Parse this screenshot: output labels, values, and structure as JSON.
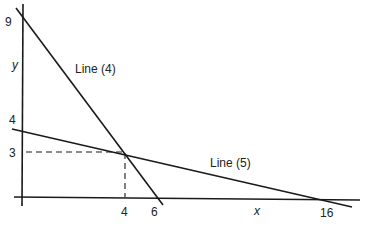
{
  "axes": {
    "x_label": "x",
    "y_label": "y",
    "x_ticks": [
      "4",
      "6",
      "16"
    ],
    "y_ticks": [
      "9",
      "4",
      "3"
    ]
  },
  "lines": [
    {
      "label": "Line (4)",
      "x_intercept": 6,
      "y_intercept": 9
    },
    {
      "label": "Line (5)",
      "x_intercept": 16,
      "y_intercept": 4
    }
  ],
  "intersection": {
    "x": "4",
    "y": "3"
  },
  "colors": {
    "line": "#1a1a1a",
    "text": "#222222",
    "background": "#ffffff"
  }
}
